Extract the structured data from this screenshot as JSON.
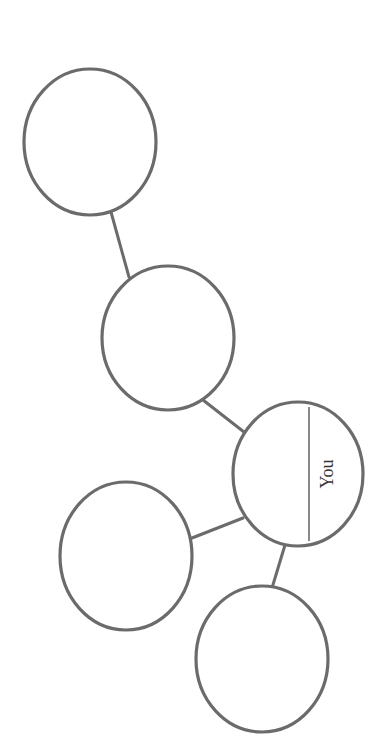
{
  "diagram": {
    "type": "concept-web",
    "orientation": "rotated-90",
    "colors": {
      "stroke": "#6b6b6b",
      "background": "#ffffff",
      "text": "#333333"
    },
    "nodes": [
      {
        "id": "node-1",
        "label": "",
        "cx": 90,
        "cy": 142,
        "rx": 66,
        "ry": 73
      },
      {
        "id": "node-2",
        "label": "",
        "cx": 168,
        "cy": 338,
        "rx": 66,
        "ry": 72
      },
      {
        "id": "node-center",
        "label": "You",
        "cx": 298,
        "cy": 474,
        "rx": 65,
        "ry": 72
      },
      {
        "id": "node-3",
        "label": "",
        "cx": 126,
        "cy": 556,
        "rx": 66,
        "ry": 74
      },
      {
        "id": "node-4",
        "label": "",
        "cx": 262,
        "cy": 659,
        "rx": 66,
        "ry": 73
      }
    ],
    "edges": [
      {
        "from": "node-1",
        "to": "node-2"
      },
      {
        "from": "node-2",
        "to": "node-center"
      },
      {
        "from": "node-center",
        "to": "node-3"
      },
      {
        "from": "node-center",
        "to": "node-4"
      }
    ],
    "center_label": "You"
  }
}
